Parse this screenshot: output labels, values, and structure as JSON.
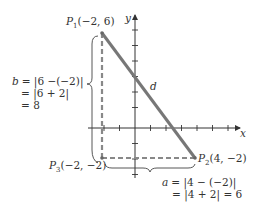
{
  "diagram": {
    "type": "distance-formula-coordinate-diagram",
    "colors": {
      "axis": "#333333",
      "segment": "#777777",
      "dashed": "#888888",
      "brace": "#444444",
      "text": "#333333",
      "background": "#ffffff"
    },
    "axes": {
      "x_label": "x",
      "y_label": "y",
      "x_ticks": [
        -3,
        -2,
        -1,
        1,
        2,
        3,
        4,
        5,
        6
      ],
      "y_ticks": [
        -3,
        -2,
        -1,
        1,
        2,
        3,
        4,
        5,
        6,
        7
      ]
    },
    "points": {
      "p1": {
        "name": "P",
        "sub": "1",
        "coords": "(−2, 6)",
        "x": -2,
        "y": 6
      },
      "p2": {
        "name": "P",
        "sub": "2",
        "coords": "(4, −2)",
        "x": 4,
        "y": -2
      },
      "p3": {
        "name": "P",
        "sub": "3",
        "coords": "(−2, −2)",
        "x": -2,
        "y": -2
      }
    },
    "segment_label": "d",
    "vertical_leg": {
      "var": "b",
      "lines": [
        "= |6 −(−2)|",
        "= |6 + 2|",
        "= 8"
      ]
    },
    "horizontal_leg": {
      "var": "a",
      "lines": [
        "= |4 − (−2)|",
        "= |4 + 2| = 6"
      ]
    }
  }
}
